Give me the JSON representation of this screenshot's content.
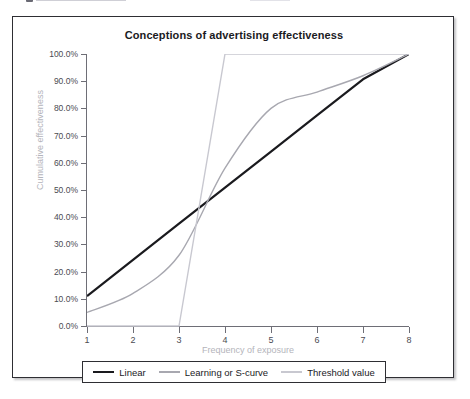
{
  "figure": {
    "title": "Conceptions of advertising effectiveness",
    "background_color": "#ffffff",
    "border_color": "#2e2e33"
  },
  "axes": {
    "x_title": "Frequency of exposure",
    "y_title": "Cumulative effectiveness",
    "x_ticks": [
      "1",
      "2",
      "3",
      "4",
      "5",
      "6",
      "7",
      "8"
    ],
    "y_ticks": [
      "0.0%",
      "10.0%",
      "20.0%",
      "30.0%",
      "40.0%",
      "50.0%",
      "60.0%",
      "70.0%",
      "80.0%",
      "90.0%",
      "100.0%"
    ],
    "axis_color": "#6e6e76",
    "tick_label_color": "#4b4b52",
    "axis_title_color": "#b4b4bb"
  },
  "legend": {
    "items": [
      {
        "label": "Linear",
        "color": "#1a1a1e"
      },
      {
        "label": "Learning or S-curve",
        "color": "#a8a8b0"
      },
      {
        "label": "Threshold value",
        "color": "#c8c8d0"
      }
    ]
  },
  "chart_data": {
    "type": "line",
    "title": "Conceptions of advertising effectiveness",
    "xlabel": "Frequency of exposure",
    "ylabel": "Cumulative effectiveness",
    "xlim": [
      1,
      8
    ],
    "ylim": [
      0,
      100
    ],
    "grid": false,
    "legend_position": "bottom",
    "x": [
      1,
      2,
      3,
      4,
      5,
      6,
      7,
      8
    ],
    "series": [
      {
        "name": "Linear",
        "color": "#1a1a1e",
        "width": 2.2,
        "values": [
          11,
          24.3,
          37.6,
          50.9,
          64.1,
          77.4,
          90.7,
          100
        ]
      },
      {
        "name": "Learning or S-curve",
        "color": "#a8a8b0",
        "width": 1.4,
        "values": [
          5,
          12,
          26,
          58,
          80,
          86,
          92,
          100
        ]
      },
      {
        "name": "Threshold value",
        "color": "#c8c8d0",
        "width": 1.4,
        "values": [
          0,
          0,
          0,
          100,
          100,
          100,
          100,
          100
        ]
      }
    ]
  }
}
